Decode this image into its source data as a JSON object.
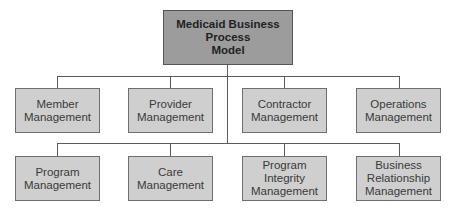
{
  "diagram": {
    "type": "org-chart",
    "colors": {
      "root_fill": "#9c9c9c",
      "child_fill": "#cfcfcf",
      "connector": "#5a5a5a",
      "border": "#6e6e6e"
    },
    "root": {
      "label": "Medicaid Business\nProcess\nModel"
    },
    "row1": [
      {
        "label": "Member\nManagement"
      },
      {
        "label": "Provider\nManagement"
      },
      {
        "label": "Contractor\nManagement"
      },
      {
        "label": "Operations\nManagement"
      }
    ],
    "row2": [
      {
        "label": "Program\nManagement"
      },
      {
        "label": "Care\nManagement"
      },
      {
        "label": "Program\nIntegrity\nManagement"
      },
      {
        "label": "Business\nRelationship\nManagement"
      }
    ]
  }
}
